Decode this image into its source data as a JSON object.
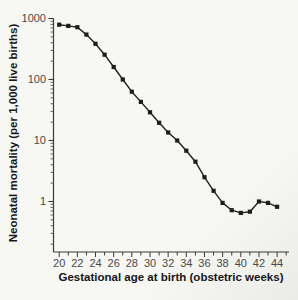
{
  "figure": {
    "background": "#f7f7f4"
  },
  "chart_data": {
    "type": "line",
    "title": "",
    "xlabel": "Gestational age at birth (obstetric weeks)",
    "ylabel": "Neonatal mortality (per 1,000 live births)",
    "x": [
      20,
      21,
      22,
      23,
      24,
      25,
      26,
      27,
      28,
      29,
      30,
      31,
      32,
      33,
      34,
      35,
      36,
      37,
      38,
      39,
      40,
      41,
      42,
      43,
      44
    ],
    "values": [
      790,
      755,
      720,
      545,
      385,
      255,
      160,
      100,
      63,
      43,
      29,
      19.5,
      13.5,
      10,
      6.8,
      4.5,
      2.5,
      1.5,
      0.95,
      0.72,
      0.65,
      0.68,
      1.0,
      0.95,
      0.82
    ],
    "x_tick_values": [
      20,
      22,
      24,
      26,
      28,
      30,
      32,
      34,
      36,
      38,
      40,
      42,
      44
    ],
    "x_tick_labels": [
      "20",
      "22",
      "24",
      "26",
      "28",
      "30",
      "32",
      "34",
      "36",
      "38",
      "40",
      "42",
      "44"
    ],
    "y_scale": "log",
    "y_tick_values": [
      1000,
      100,
      10,
      1
    ],
    "y_tick_labels": [
      "1000",
      "100",
      "10",
      "1"
    ],
    "ylim": [
      0.15,
      1000
    ],
    "xlim": [
      19.4,
      45.3
    ],
    "grid": false,
    "legend": null,
    "marker": "square",
    "line_color": "#222222",
    "marker_color": "#1c1c1c",
    "axis_color": "#3a3a3a",
    "tick_label_color": "#4a4a4a"
  }
}
